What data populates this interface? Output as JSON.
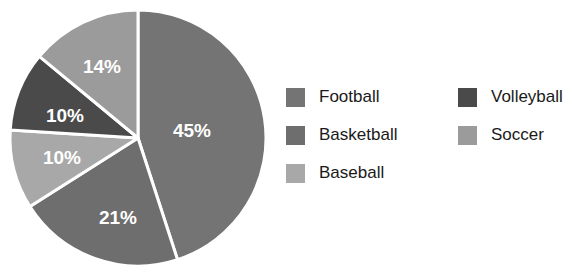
{
  "chart_data": {
    "type": "pie",
    "title": "",
    "labels": [
      "Football",
      "Basketball",
      "Baseball",
      "Volleyball",
      "Soccer"
    ],
    "values": [
      45,
      21,
      10,
      10,
      14
    ],
    "value_labels": [
      "45%",
      "21%",
      "10%",
      "10%",
      "14%"
    ],
    "colors": [
      "#747474",
      "#6e6e6e",
      "#a8a8a8",
      "#4a4a4a",
      "#9b9b9b"
    ],
    "start_angle_deg": 0,
    "direction": "clockwise",
    "slice_separator_color": "#ffffff",
    "slice_label_color": "#ffffff",
    "legend_position": "right",
    "legend_columns": 2,
    "background_color": "#ffffff"
  },
  "pie": {
    "slices": [
      {
        "label": "Football",
        "value_label": "45%",
        "color": "#747474",
        "label_x": 186,
        "label_y": 126
      },
      {
        "label": "Basketball",
        "value_label": "21%",
        "color": "#6e6e6e",
        "label_x": 112,
        "label_y": 213
      },
      {
        "label": "Baseball",
        "value_label": "10%",
        "color": "#a8a8a8",
        "label_x": 56,
        "label_y": 153
      },
      {
        "label": "Volleyball",
        "value_label": "10%",
        "color": "#4a4a4a",
        "label_x": 59,
        "label_y": 111
      },
      {
        "label": "Soccer",
        "value_label": "14%",
        "color": "#9b9b9b",
        "label_x": 96,
        "label_y": 62
      }
    ]
  },
  "legend": {
    "columns": [
      {
        "items": [
          {
            "label": "Football",
            "color": "#747474"
          },
          {
            "label": "Basketball",
            "color": "#6e6e6e"
          },
          {
            "label": "Baseball",
            "color": "#a8a8a8"
          }
        ]
      },
      {
        "items": [
          {
            "label": "Volleyball",
            "color": "#4a4a4a"
          },
          {
            "label": "Soccer",
            "color": "#9b9b9b"
          }
        ]
      }
    ]
  }
}
